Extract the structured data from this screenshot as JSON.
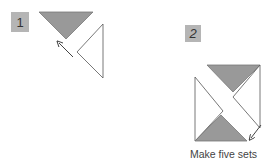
{
  "steps": [
    {
      "label": "1"
    },
    {
      "label": "2"
    }
  ],
  "caption": "Make five sets",
  "colors": {
    "gray_fill": "#999999",
    "outline": "#555555",
    "label_bg": "#b5b5b5"
  }
}
